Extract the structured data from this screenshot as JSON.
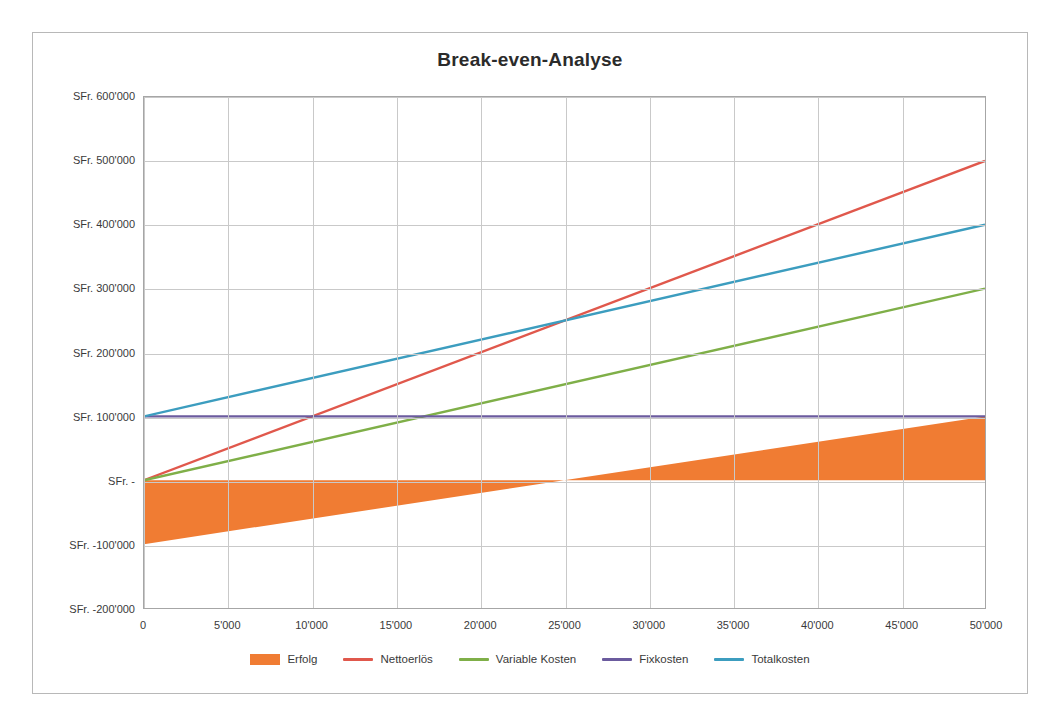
{
  "chart_data": {
    "type": "line",
    "title": "Break-even-Analyse",
    "xlabel": "",
    "ylabel": "",
    "grid": true,
    "legend_position": "bottom",
    "xlim": [
      0,
      50000
    ],
    "ylim": [
      -200000,
      600000
    ],
    "x_ticks": [
      0,
      5000,
      10000,
      15000,
      20000,
      25000,
      30000,
      35000,
      40000,
      45000,
      50000
    ],
    "x_tick_labels": [
      "0",
      "5'000",
      "10'000",
      "15'000",
      "20'000",
      "25'000",
      "30'000",
      "35'000",
      "40'000",
      "45'000",
      "50'000"
    ],
    "y_ticks": [
      600000,
      500000,
      400000,
      300000,
      200000,
      100000,
      0,
      -100000,
      -200000
    ],
    "y_tick_labels": [
      "SFr. 600'000",
      "SFr. 500'000",
      "SFr. 400'000",
      "SFr. 300'000",
      "SFr. 200'000",
      "SFr. 100'000",
      "SFr. -",
      "SFr. -100'000",
      "SFr. -200'000"
    ],
    "break_even_x": 25000,
    "x": [
      0,
      50000
    ],
    "series": [
      {
        "name": "Erfolg",
        "type": "area",
        "color": "#F07C33",
        "values": [
          -100000,
          100000
        ],
        "baseline": 0
      },
      {
        "name": "Nettoerlös",
        "type": "line",
        "color": "#E0584C",
        "values": [
          0,
          500000
        ]
      },
      {
        "name": "Variable Kosten",
        "type": "line",
        "color": "#7FAF48",
        "values": [
          0,
          300000
        ]
      },
      {
        "name": "Fixkosten",
        "type": "line",
        "color": "#6B5B9E",
        "values": [
          100000,
          100000
        ]
      },
      {
        "name": "Totalkosten",
        "type": "line",
        "color": "#3C9DBF",
        "values": [
          100000,
          400000
        ]
      }
    ]
  },
  "colors": {
    "frame_border": "#b8b8b8",
    "plot_border": "#a6a6a6",
    "gridline": "#c9c9c9",
    "title_text": "#2b2b2b",
    "tick_text": "#3a3a3a",
    "background": "#ffffff"
  }
}
